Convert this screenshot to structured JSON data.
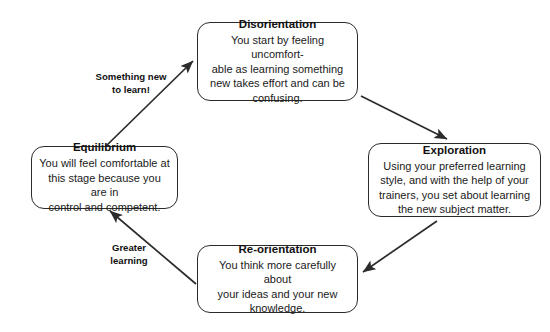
{
  "diagram": {
    "type": "cycle",
    "background_color": "#ffffff",
    "line_color": "#2b2b2b",
    "text_color": "#111111",
    "nodes": [
      {
        "id": "disorientation",
        "title": "Disorientation",
        "body": "You start by feeling uncomfort-\nable as learning something\nnew takes effort and can be\nconfusing."
      },
      {
        "id": "exploration",
        "title": "Exploration",
        "body": "Using your preferred learning\nstyle, and with the help of your\ntrainers, you set about learning\nthe new subject matter."
      },
      {
        "id": "reorientation",
        "title": "Re-orientation",
        "body": "You think more carefully about\nyour ideas and your new\nknowledge."
      },
      {
        "id": "equilibrium",
        "title": "Equilibrium",
        "body": "You will feel comfortable at\nthis stage because you are in\ncontrol and competent."
      }
    ],
    "edges": [
      {
        "id": "equilibrium-to-disorientation",
        "from": "equilibrium",
        "to": "disorientation",
        "label": "Something new\nto learn!"
      },
      {
        "id": "disorientation-to-exploration",
        "from": "disorientation",
        "to": "exploration",
        "label": ""
      },
      {
        "id": "exploration-to-reorientation",
        "from": "exploration",
        "to": "reorientation",
        "label": ""
      },
      {
        "id": "reorientation-to-equilibrium",
        "from": "reorientation",
        "to": "equilibrium",
        "label": "Greater\nlearning"
      }
    ]
  }
}
